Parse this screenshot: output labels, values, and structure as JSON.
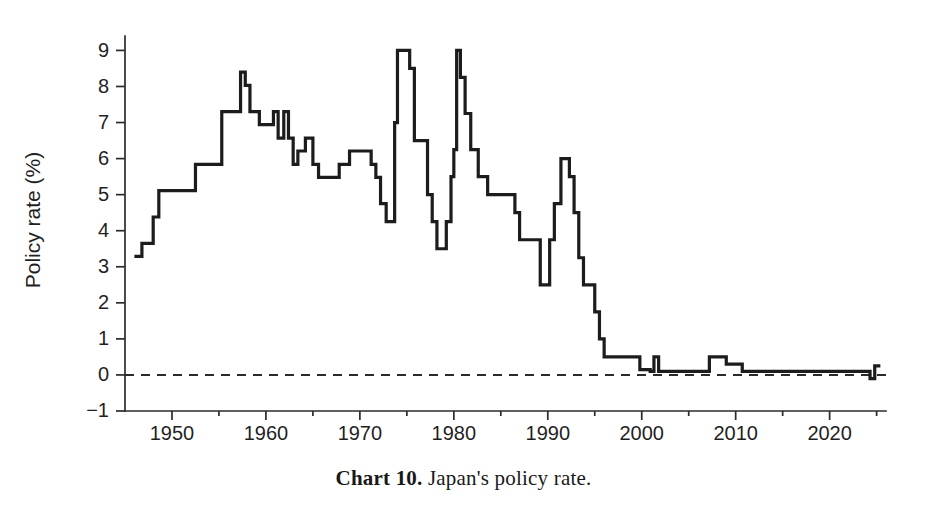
{
  "figure": {
    "caption_label": "Chart 10.",
    "caption_text": " Japan's policy rate.",
    "background_color": "#ffffff",
    "line_color": "#1c1c1c",
    "axis_color": "#2b2b2b"
  },
  "chart_data": {
    "type": "line",
    "title": "Chart 10. Japan's policy rate.",
    "xlabel": "",
    "ylabel": "Policy rate (%)",
    "xlim": [
      1945,
      2026
    ],
    "ylim": [
      -1,
      9.4
    ],
    "grid": false,
    "legend": null,
    "step_style": "post",
    "xticks": [
      1950,
      1960,
      1970,
      1980,
      1990,
      2000,
      2010,
      2020
    ],
    "xtick_labels": [
      "1950",
      "1960",
      "1970",
      "1980",
      "1990",
      "2000",
      "2010",
      "2020"
    ],
    "xminor_ticks": [
      1955,
      1965,
      1975,
      1985,
      1995,
      2005,
      2015,
      2025
    ],
    "yticks": [
      -1,
      0,
      1,
      2,
      3,
      4,
      5,
      6,
      7,
      8,
      9
    ],
    "ytick_labels": [
      "−1",
      "0",
      "1",
      "2",
      "3",
      "4",
      "5",
      "6",
      "7",
      "8",
      "9"
    ],
    "reference_lines": [
      {
        "name": "zero-line",
        "axis": "y",
        "value": 0,
        "style": "dashed"
      }
    ],
    "series": [
      {
        "name": "Japan policy rate",
        "units": "percent",
        "x": [
          1946.0,
          1946.8,
          1947.4,
          1948.0,
          1948.6,
          1949.2,
          1951.0,
          1952.5,
          1955.3,
          1957.3,
          1957.8,
          1958.3,
          1958.8,
          1959.3,
          1960.0,
          1960.8,
          1961.3,
          1961.9,
          1962.4,
          1962.9,
          1963.4,
          1964.2,
          1965.0,
          1965.6,
          1967.0,
          1967.8,
          1968.3,
          1968.9,
          1969.5,
          1970.6,
          1971.2,
          1971.7,
          1972.2,
          1972.8,
          1973.3,
          1973.7,
          1974.0,
          1974.4,
          1975.3,
          1975.8,
          1976.4,
          1977.2,
          1977.7,
          1978.2,
          1978.6,
          1979.2,
          1979.7,
          1980.0,
          1980.3,
          1980.7,
          1981.2,
          1981.8,
          1982.6,
          1983.6,
          1986.0,
          1986.5,
          1987.0,
          1989.2,
          1989.7,
          1990.2,
          1990.7,
          1991.4,
          1991.9,
          1992.3,
          1992.8,
          1993.3,
          1993.8,
          1995.0,
          1995.5,
          1996.0,
          1999.2,
          1999.8,
          2000.9,
          2001.3,
          2001.8,
          2006.5,
          2007.2,
          2008.8,
          2009.0,
          2010.7,
          2016.1,
          2024.3,
          2024.8
        ],
        "y": [
          3.29,
          3.65,
          3.65,
          4.38,
          5.11,
          5.11,
          5.11,
          5.84,
          7.3,
          8.4,
          8.03,
          7.3,
          7.3,
          6.94,
          6.94,
          7.3,
          6.57,
          7.3,
          6.57,
          5.84,
          6.21,
          6.57,
          5.84,
          5.48,
          5.48,
          5.84,
          5.84,
          6.21,
          6.21,
          6.21,
          5.84,
          5.48,
          4.75,
          4.25,
          4.25,
          7.0,
          9.0,
          9.0,
          8.5,
          6.5,
          6.5,
          5.0,
          4.25,
          3.5,
          3.5,
          4.25,
          5.5,
          6.25,
          9.0,
          8.25,
          7.25,
          6.25,
          5.5,
          5.0,
          5.0,
          4.5,
          3.75,
          2.5,
          2.5,
          3.75,
          4.75,
          6.0,
          6.0,
          5.5,
          4.5,
          3.25,
          2.5,
          1.75,
          1.0,
          0.5,
          0.5,
          0.15,
          0.1,
          0.5,
          0.1,
          0.1,
          0.5,
          0.5,
          0.3,
          0.1,
          0.1,
          -0.1,
          0.25
        ],
        "notes": "Step series; key levels: ~3.3% (1946), 8.4% peak (1957), 9.0% peaks (1974 and 1980), 6.0% peak (1991), near 0% from 1999, slightly negative (−0.1%) from 2016, rising to ~0.25% in 2024."
      }
    ]
  }
}
